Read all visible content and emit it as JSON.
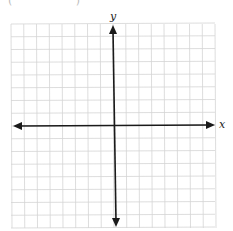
{
  "fragment_text": "( )",
  "graph": {
    "x_label": "x",
    "y_label": "y",
    "grid_cells": 16,
    "grid_color": "#d4d4d4",
    "axis_color": "#1a1a1a"
  }
}
